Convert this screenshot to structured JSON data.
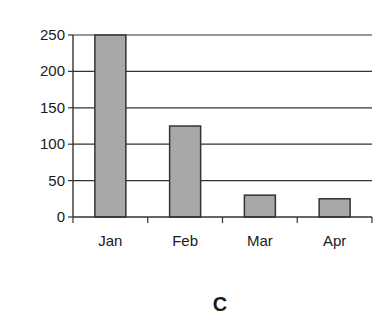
{
  "chart_data": {
    "type": "bar",
    "title": "",
    "xlabel": "",
    "ylabel": "",
    "categories": [
      "Jan",
      "Feb",
      "Mar",
      "Apr"
    ],
    "values": [
      250,
      125,
      30,
      25
    ],
    "ylim": [
      0,
      250
    ],
    "yticks": [
      0,
      50,
      100,
      150,
      200,
      250
    ],
    "grid": true,
    "legend": null,
    "bar_color": "#a8a8a8",
    "bar_edge_color": "#333333",
    "panel_label": "C"
  }
}
